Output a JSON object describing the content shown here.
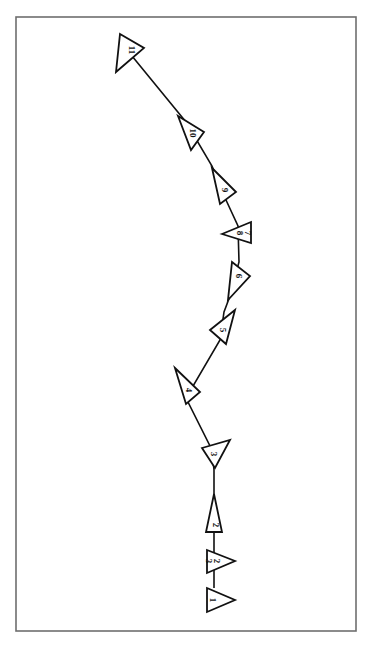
{
  "diagram": {
    "title": "",
    "frame": {
      "x": 16,
      "y": 17,
      "width": 340,
      "height": 614,
      "stroke": "#6e6e6e"
    },
    "line_color": "#111111",
    "markers": [
      {
        "id": "m11",
        "label": "11",
        "cx": 131,
        "cy": 62,
        "points": "120,34 144,48 116,72",
        "lx": 131,
        "ly": 50,
        "rot": 90,
        "path": [
          132,
          58
        ]
      },
      {
        "id": "m10",
        "label": "10",
        "cx": 190,
        "cy": 130,
        "points": "178,116 204,132 191,150",
        "lx": 192,
        "ly": 133,
        "rot": 90,
        "path": [
          186,
          122
        ]
      },
      {
        "id": "m9",
        "label": "9",
        "cx": 222,
        "cy": 187,
        "points": "212,168 236,192 220,204",
        "lx": 224,
        "ly": 190,
        "rot": 90,
        "path": [
          218,
          178
        ]
      },
      {
        "id": "m78",
        "label": "7\n8",
        "label_a": "7",
        "label_b": "8",
        "cx": 240,
        "cy": 232,
        "points": "222,234 251,222 251,243",
        "lx": 243,
        "ly": 233,
        "rot": 90,
        "path": [
          239,
          228
        ]
      },
      {
        "id": "m6",
        "label": "6",
        "cx": 238,
        "cy": 278,
        "points": "232,262 250,276 228,300",
        "lx": 238,
        "ly": 276,
        "rot": 90,
        "path": [
          239,
          262
        ]
      },
      {
        "id": "m5",
        "label": "5",
        "cx": 224,
        "cy": 328,
        "points": "210,330 235,310 226,344",
        "lx": 222,
        "ly": 330,
        "rot": 90,
        "path": [
          218,
          338
        ]
      },
      {
        "id": "m4",
        "label": "4",
        "cx": 188,
        "cy": 388,
        "points": "175,368 200,392 186,404",
        "lx": 188,
        "ly": 390,
        "rot": 90,
        "path": [
          182,
          380
        ]
      },
      {
        "id": "m3",
        "label": "3",
        "cx": 214,
        "cy": 452,
        "points": "202,448 230,440 215,468",
        "lx": 213,
        "ly": 454,
        "rot": 90,
        "path": [
          213,
          446
        ]
      },
      {
        "id": "m2",
        "label": "2",
        "cx": 214,
        "cy": 510,
        "points": "214,494 222,532 206,532",
        "lx": 215,
        "ly": 525,
        "rot": 90,
        "path": [
          214,
          510
        ]
      },
      {
        "id": "m23",
        "label": "23",
        "label_a": "2",
        "label_b": "3",
        "cx": 214,
        "cy": 560,
        "points": "207,550 235,561 207,573",
        "lx": 212,
        "ly": 561,
        "rot": 90,
        "path": [
          214,
          561
        ]
      },
      {
        "id": "m1",
        "label": "1",
        "cx": 214,
        "cy": 600,
        "points": "207,588 235,600 207,612",
        "lx": 212,
        "ly": 600,
        "rot": 90,
        "path": [
          214,
          600
        ]
      }
    ],
    "polyline": [
      [
        132,
        56
      ],
      [
        186,
        122
      ],
      [
        212,
        166
      ],
      [
        226,
        200
      ],
      [
        238,
        226
      ],
      [
        239,
        262
      ],
      [
        230,
        296
      ],
      [
        224,
        312
      ],
      [
        220,
        340
      ],
      [
        186,
        398
      ],
      [
        212,
        450
      ],
      [
        214,
        470
      ],
      [
        214,
        494
      ],
      [
        214,
        532
      ],
      [
        214,
        550
      ],
      [
        214,
        573
      ],
      [
        214,
        588
      ]
    ]
  }
}
